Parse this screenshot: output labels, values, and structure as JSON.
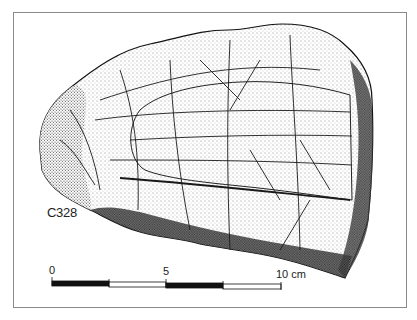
{
  "figure": {
    "specimen_label": "C328",
    "scale_bar": {
      "labels": [
        "0",
        "5",
        "10 cm"
      ],
      "unit": "cm",
      "max": 10,
      "segments": [
        {
          "from": 0,
          "to": 2.5,
          "fill": "#111111"
        },
        {
          "from": 2.5,
          "to": 5,
          "fill": "#ffffff"
        },
        {
          "from": 5,
          "to": 7.5,
          "fill": "#111111"
        },
        {
          "from": 7.5,
          "to": 10,
          "fill": "#ffffff"
        }
      ]
    },
    "colors": {
      "ink": "#111111",
      "frame": "#8a8a8a",
      "background": "#ffffff"
    }
  }
}
